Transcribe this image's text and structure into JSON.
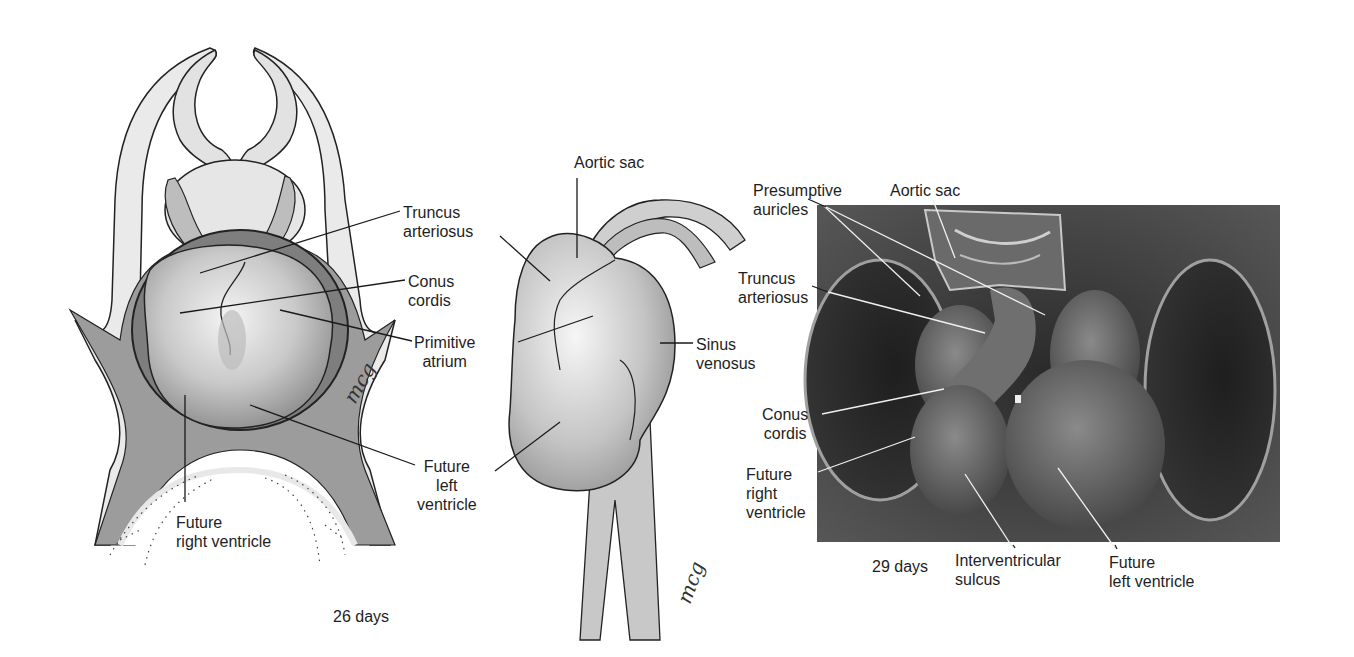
{
  "figure": {
    "panels": [
      {
        "id": "ventral-view-26-days",
        "caption": "26 days",
        "signature": "mcg",
        "labels": [
          {
            "text": "Truncus\narteriosus"
          },
          {
            "text": "Conus\ncordis"
          },
          {
            "text": "Primitive\natrium"
          },
          {
            "text": "Future\nleft\nventricle"
          },
          {
            "text": "Future\nright ventricle"
          }
        ]
      },
      {
        "id": "lateral-view-26-days",
        "signature": "mcg",
        "labels": [
          {
            "text": "Aortic sac"
          },
          {
            "text": "Sinus\nvenosus"
          }
        ]
      },
      {
        "id": "sem-29-days",
        "caption": "29 days",
        "labels": [
          {
            "text": "Presumptive\nauricles"
          },
          {
            "text": "Aortic sac"
          },
          {
            "text": "Truncus\narteriosus"
          },
          {
            "text": "Conus\ncordis"
          },
          {
            "text": "Future\nright\nventricle"
          },
          {
            "text": "Interventricular\nsulcus"
          },
          {
            "text": "Future\nleft ventricle"
          }
        ]
      }
    ]
  }
}
